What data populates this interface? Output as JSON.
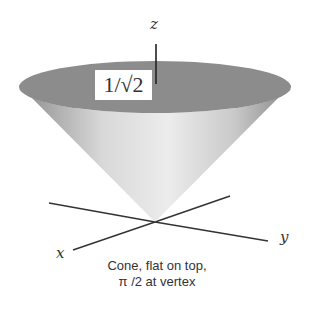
{
  "diagram": {
    "axis_labels": {
      "x": "x",
      "y": "y",
      "z": "z"
    },
    "value_label": "1/√2",
    "caption_line1": "Cone, flat on top,",
    "caption_line2": "π /2 at vertex",
    "colors": {
      "top_disk": "#8c8c8c",
      "cone_light": "#e2e2e2",
      "cone_dark": "#9a9a9a",
      "axis": "#333333"
    }
  }
}
